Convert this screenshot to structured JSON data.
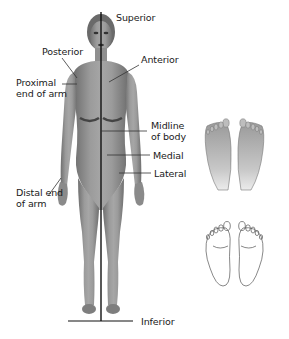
{
  "figure": {
    "labels": {
      "superior": "Superior",
      "inferior": "Inferior",
      "posterior": "Posterior",
      "anterior": "Anterior",
      "proximal_line1": "Proximal",
      "proximal_line2": "end of arm",
      "distal_line1": "Distal end",
      "distal_line2": "of arm",
      "midline_line1": "Midline",
      "midline_line2": "of body",
      "medial": "Medial",
      "lateral": "Lateral"
    },
    "insets": [
      {
        "title": "Dorsal surface",
        "view": "top of feet",
        "fill": "#e8e8e8"
      },
      {
        "title": "Plantar surface",
        "view": "soles of feet",
        "fill": "#b8b8b8"
      }
    ],
    "colors": {
      "skin": "#9a9a9a",
      "skin_shadow": "#6e6e6e",
      "line": "#111111",
      "label_text": "#1a1a1a"
    }
  }
}
